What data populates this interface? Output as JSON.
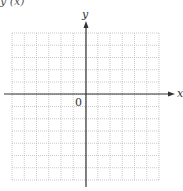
{
  "top_fragment": "y (x)",
  "graph": {
    "x_axis_label": "x",
    "y_axis_label": "y",
    "origin_label": "0",
    "grid": {
      "columns": 12,
      "rows": 12,
      "left": 12,
      "top": 33,
      "right": 159,
      "bottom": 180,
      "line_color": "#bdbdbd",
      "line_style": "dotted"
    },
    "axes": {
      "color": "#333333",
      "x_axis_y": 94,
      "y_axis_x": 86
    }
  }
}
